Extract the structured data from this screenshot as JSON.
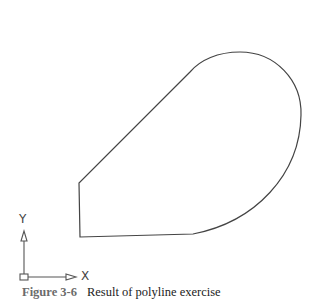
{
  "figure": {
    "number_label": "Figure 3-6",
    "caption_text": "Result of polyline exercise"
  },
  "ucs_icon": {
    "x_label": "X",
    "y_label": "Y"
  },
  "drawing": {
    "stroke_color": "#444444",
    "shape": "closed polyline with straight segments and an arc"
  }
}
